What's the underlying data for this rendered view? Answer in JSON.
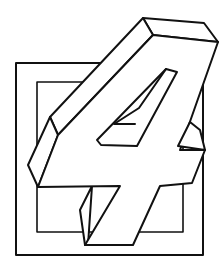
{
  "illustration": {
    "subject": "3D numeral four in front of square frame",
    "numeral": "4",
    "colors": {
      "background": "#ffffff",
      "stroke": "#111111",
      "face_fill": "#ffffff"
    }
  }
}
